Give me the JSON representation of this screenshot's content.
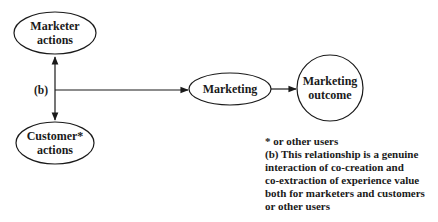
{
  "diagram": {
    "nodes": {
      "marketer_actions": {
        "lines": [
          "Marketer",
          "actions"
        ]
      },
      "customer_actions": {
        "lines": [
          "Customer*",
          "actions"
        ]
      },
      "marketing": {
        "lines": [
          "Marketing"
        ]
      },
      "marketing_outcome": {
        "lines": [
          "Marketing",
          "outcome"
        ]
      }
    },
    "edges": {
      "bidirectional_label": "(b)"
    },
    "notes": {
      "lines": [
        "*  or other users",
        "(b) This relationship is a genuine",
        "interaction of co-creation and",
        "co-extraction of experience value",
        "both for marketers and customers",
        "or other users"
      ]
    },
    "colors": {
      "stroke": "#1a1a1a",
      "background": "#ffffff"
    }
  }
}
